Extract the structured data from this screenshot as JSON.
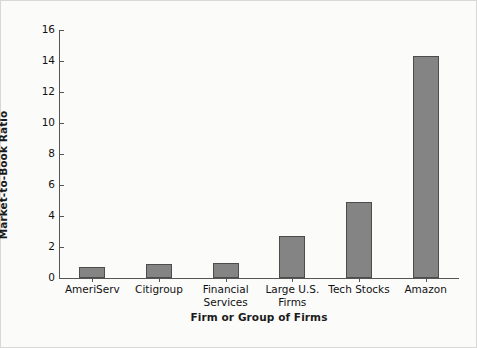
{
  "chart_data": {
    "type": "bar",
    "title": "",
    "xlabel": "Firm or Group of Firms",
    "ylabel": "Market-to-Book Ratio",
    "categories": [
      "AmeriServ",
      "Citigroup",
      "Financial\nServices",
      "Large U.S.\nFirms",
      "Tech Stocks",
      "Amazon"
    ],
    "values": [
      0.7,
      0.9,
      1.0,
      2.7,
      4.9,
      14.3
    ],
    "ylim": [
      0,
      16
    ],
    "yticks": [
      0,
      2,
      4,
      6,
      8,
      10,
      12,
      14,
      16
    ],
    "ytick_labels": [
      "0",
      "2",
      "4",
      "6",
      "8",
      "10",
      "12",
      "14",
      "16"
    ],
    "grid": false,
    "legend": null,
    "bar_color": "#848484",
    "bar_edge_color": "#4c4c4c",
    "background_color": "#fbfbfa",
    "frame_color": "#d8d8d6",
    "axis_color": "#555555"
  }
}
